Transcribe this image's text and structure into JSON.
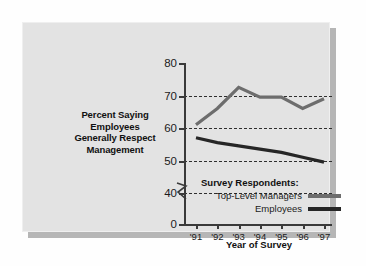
{
  "card": {
    "background_color": "#e3e3e3",
    "shadow_color": "#b6b6b6"
  },
  "chart_data": {
    "type": "line",
    "title": "",
    "ylabel": "Percent Saying Employees Generally Respect Management",
    "ylabel_lines": [
      "Percent Saying",
      "Employees",
      "Generally Respect",
      "Management"
    ],
    "xlabel": "Year of Survey",
    "categories": [
      "'91",
      "'92",
      "'93",
      "'94",
      "'95",
      "'96",
      "'97"
    ],
    "x_tick_labels": [
      "'91",
      "'92",
      "'93",
      "'94",
      "'95",
      "'96",
      "'97"
    ],
    "y_tick_labels": [
      "0",
      "40",
      "50",
      "60",
      "70",
      "80"
    ],
    "ylim": [
      40,
      80
    ],
    "y_axis_break": true,
    "y_axis_break_glyph": "axis-break-zigzag",
    "grid": true,
    "gridlines": [
      40,
      50,
      60,
      70
    ],
    "grid_style": "dashed",
    "legend_position": "inside-bottom-right",
    "legend_title": "Survey Respondents:",
    "series": [
      {
        "name": "Top-Level Managers",
        "color": "#6d6d6d",
        "values": [
          61,
          66,
          72.5,
          69.5,
          69.5,
          66,
          69
        ]
      },
      {
        "name": "Employees",
        "color": "#262626",
        "values": [
          57,
          55.5,
          54.5,
          53.5,
          52.5,
          51,
          49.5
        ]
      }
    ]
  }
}
